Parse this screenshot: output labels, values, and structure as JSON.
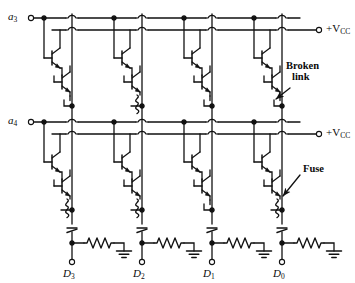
{
  "figure": {
    "kind": "circuit-schematic",
    "stroke_color": "#111111",
    "background_color": "#ffffff"
  },
  "inputs": [
    {
      "id": "a3",
      "label_text": "a",
      "label_sub": "3",
      "row": "top"
    },
    {
      "id": "a4",
      "label_text": "a",
      "label_sub": "4",
      "row": "bottom"
    }
  ],
  "supplies": [
    {
      "id": "vcc-top",
      "label_text": "+V",
      "label_sub": "CC",
      "row": "top"
    },
    {
      "id": "vcc-bottom",
      "label_text": "+V",
      "label_sub": "CC",
      "row": "bottom"
    }
  ],
  "outputs": [
    {
      "id": "D3",
      "label_text": "D",
      "label_sub": "3"
    },
    {
      "id": "D2",
      "label_text": "D",
      "label_sub": "2"
    },
    {
      "id": "D1",
      "label_text": "D",
      "label_sub": "1"
    },
    {
      "id": "D0",
      "label_text": "D",
      "label_sub": "0"
    }
  ],
  "annotations": [
    {
      "id": "broken-link",
      "line1": "Broken",
      "line2": "link"
    },
    {
      "id": "fuse",
      "line1": "Fuse",
      "line2": ""
    }
  ],
  "cells": {
    "top_row": [
      {
        "column": "D3",
        "link": "broken"
      },
      {
        "column": "D2",
        "link": "intact"
      },
      {
        "column": "D1",
        "link": "broken"
      },
      {
        "column": "D0",
        "link": "broken"
      }
    ],
    "bottom_row": [
      {
        "column": "D3",
        "link": "intact"
      },
      {
        "column": "D2",
        "link": "intact"
      },
      {
        "column": "D1",
        "link": "broken"
      },
      {
        "column": "D0",
        "link": "intact"
      }
    ]
  },
  "components": {
    "transistor_count": 16,
    "fuse_count": 4,
    "broken_link_count": 4,
    "resistor_count": 4,
    "ground_count": 4,
    "emitter_follower_count": 4
  }
}
